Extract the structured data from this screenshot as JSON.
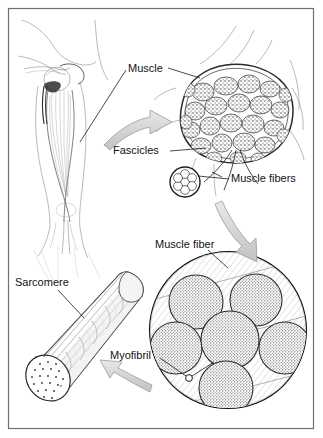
{
  "figure": {
    "background_color": "#ffffff",
    "border_color": "#6e6e6e",
    "ink_color": "#1a1a1a",
    "arrow_fill": "#d5d5d5",
    "arrow_stroke": "#8a8a8a",
    "stipple_color": "#4a4a4a"
  },
  "labels": [
    {
      "id": "muscle",
      "text": "Muscle",
      "x": 128,
      "y": 72,
      "anchor": "start"
    },
    {
      "id": "fascicles",
      "text": "Fascicles",
      "x": 113,
      "y": 154,
      "anchor": "start"
    },
    {
      "id": "muscle-fibers",
      "text": "Muscle fibers",
      "x": 231,
      "y": 182,
      "anchor": "start"
    },
    {
      "id": "muscle-fiber",
      "text": "Muscle fiber",
      "x": 155,
      "y": 248,
      "anchor": "start"
    },
    {
      "id": "sarcomere",
      "text": "Sarcomere",
      "x": 15,
      "y": 286,
      "anchor": "start"
    },
    {
      "id": "myofibril",
      "text": "Myofibril",
      "x": 110,
      "y": 359,
      "anchor": "start"
    }
  ],
  "panels": [
    {
      "id": "arm-illustration",
      "name": "Human arm with biceps muscle"
    },
    {
      "id": "muscle-cross-section",
      "name": "Muscle cross section showing fascicles"
    },
    {
      "id": "fascicle-detail-circle",
      "name": "Fascicle circle showing muscle fibers"
    },
    {
      "id": "sarcomere-cylinder",
      "name": "Myofibril cylinder showing sarcomeres"
    },
    {
      "id": "muscle-fiber-circle",
      "name": "Muscle fiber cross section showing myofibrils"
    }
  ],
  "arrows": [
    {
      "id": "arrow-arm-to-cross-section",
      "direction": "right"
    },
    {
      "id": "arrow-fascicle-to-fiber",
      "direction": "down"
    },
    {
      "id": "arrow-fiber-to-sarcomere",
      "direction": "left"
    }
  ],
  "counts": {
    "fascicles_in_cross_section": 26,
    "fibers_in_small_circle": 7,
    "myofibrils_in_large_circle": 6
  }
}
